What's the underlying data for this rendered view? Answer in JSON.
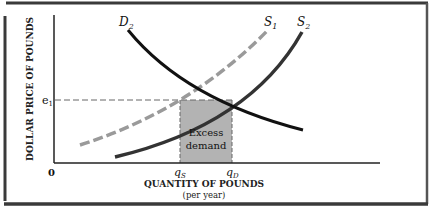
{
  "figure": {
    "y_axis_label": "DOLLAR PRICE OF POUNDS",
    "x_axis_label": "QUANTITY OF POUNDS",
    "x_axis_sublabel": "(per year)",
    "origin_label": "0",
    "price_tick_label": "e",
    "price_tick_subscript": "1",
    "qs_label": "q",
    "qs_subscript": "S",
    "qd_label": "q",
    "qd_subscript": "D",
    "region_label_line1": "Excess",
    "region_label_line2": "demand",
    "curves": [
      {
        "name": "D",
        "subscript": "2",
        "style": "solid"
      },
      {
        "name": "S",
        "subscript": "1",
        "style": "dashed"
      },
      {
        "name": "S",
        "subscript": "2",
        "style": "solid"
      }
    ],
    "colors": {
      "frame": "#3a3a3a",
      "demand": "#111111",
      "supply_s1": "#9a9a9a",
      "supply_s2": "#333333",
      "shaded_region": "#b3b3b3",
      "guides": "#666666"
    }
  }
}
